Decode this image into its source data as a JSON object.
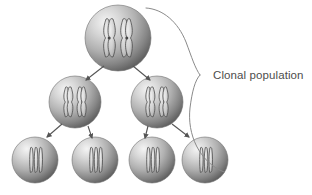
{
  "figure": {
    "background_color": "#ffffff",
    "width": 312,
    "height": 195
  },
  "annotation": {
    "label": "Clonal population",
    "text_color": "#4d4d4d",
    "bracket_color": "#8a8a8a"
  },
  "cell_style": {
    "highlight_color": "#f2f2f2",
    "midtone_color": "#b8b8b8",
    "shadow_color": "#5f5f5f",
    "outline_color": "#707070",
    "chromosome_fill": "#d8d8d8",
    "chromosome_outline": "#5a5a5a"
  },
  "arrow_color": "#555555",
  "generations": [
    {
      "name": "parent-cell",
      "row": 1,
      "label": "Generation 1",
      "cells": [
        {
          "id": "cell-g1-1",
          "cx": 118,
          "cy": 38,
          "r": 33,
          "chromosome_style": "duplicated-x"
        }
      ]
    },
    {
      "name": "daughter-cells",
      "row": 2,
      "label": "Generation 2",
      "cells": [
        {
          "id": "cell-g2-1",
          "cx": 75,
          "cy": 102,
          "r": 26,
          "chromosome_style": "duplicated-x"
        },
        {
          "id": "cell-g2-2",
          "cx": 157,
          "cy": 102,
          "r": 26,
          "chromosome_style": "duplicated-x"
        }
      ]
    },
    {
      "name": "granddaughter-cells",
      "row": 3,
      "label": "Generation 3",
      "cells": [
        {
          "id": "cell-g3-1",
          "cx": 35,
          "cy": 160,
          "r": 23,
          "chromosome_style": "single-pair"
        },
        {
          "id": "cell-g3-2",
          "cx": 95,
          "cy": 160,
          "r": 23,
          "chromosome_style": "single-pair"
        },
        {
          "id": "cell-g3-3",
          "cx": 152,
          "cy": 160,
          "r": 23,
          "chromosome_style": "single-pair"
        },
        {
          "id": "cell-g3-4",
          "cx": 205,
          "cy": 160,
          "r": 23,
          "chromosome_style": "single-pair"
        }
      ]
    }
  ],
  "arrows": [
    {
      "id": "arrow-g1-to-g2-left",
      "x1": 104,
      "y1": 66,
      "x2": 86,
      "y2": 80
    },
    {
      "id": "arrow-g1-to-g2-right",
      "x1": 133,
      "y1": 66,
      "x2": 150,
      "y2": 80
    },
    {
      "id": "arrow-g2-to-g3-a",
      "x1": 62,
      "y1": 124,
      "x2": 47,
      "y2": 137
    },
    {
      "id": "arrow-g2-to-g3-b",
      "x1": 88,
      "y1": 126,
      "x2": 92,
      "y2": 138
    },
    {
      "id": "arrow-g2-to-g3-c",
      "x1": 148,
      "y1": 126,
      "x2": 145,
      "y2": 138
    },
    {
      "id": "arrow-g2-to-g3-d",
      "x1": 172,
      "y1": 124,
      "x2": 189,
      "y2": 137
    }
  ]
}
